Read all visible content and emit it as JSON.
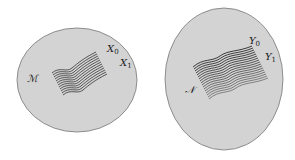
{
  "left": {
    "manifold_label": "ℳ",
    "x0": "X",
    "x0_sub": "0",
    "x1": "X",
    "x1_sub": "1"
  },
  "right": {
    "manifold_label": "𝒩",
    "y0": "Y",
    "y0_sub": "0",
    "y1": "Y",
    "y1_sub": "1"
  },
  "colors": {
    "fill": "#d3d3d3",
    "stroke": "#777777",
    "lines": "#333333"
  }
}
